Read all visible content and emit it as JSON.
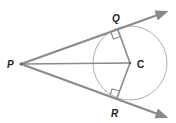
{
  "diagram": {
    "type": "geometry",
    "points": {
      "P": {
        "label": "P",
        "x": 21,
        "y": 64
      },
      "Q": {
        "label": "Q",
        "x": 118,
        "y": 30
      },
      "R": {
        "label": "R",
        "x": 117,
        "y": 98
      },
      "C": {
        "label": "C",
        "x": 130,
        "y": 63
      }
    },
    "circle": {
      "cx": 130,
      "cy": 63,
      "r": 37
    },
    "rays": [
      {
        "from": "P",
        "through": "Q",
        "tip": {
          "x": 166,
          "y": 12
        }
      },
      {
        "from": "P",
        "through": "R",
        "tip": {
          "x": 166,
          "y": 117
        }
      }
    ],
    "segments": [
      [
        "P",
        "C"
      ],
      [
        "C",
        "Q"
      ],
      [
        "C",
        "R"
      ]
    ],
    "right_angles": [
      "Q",
      "R"
    ],
    "colors": {
      "line": "#8a8a8a",
      "circle": "#9a9a9a",
      "label": "#222222"
    }
  }
}
